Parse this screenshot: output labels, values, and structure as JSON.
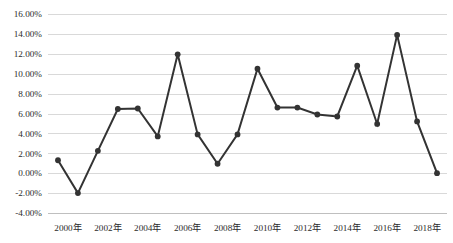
{
  "chart_data": {
    "type": "line",
    "title": "",
    "subtitle": "",
    "xlabel": "",
    "ylabel": "",
    "grid": true,
    "legend": false,
    "legend_position": "none",
    "series_color": "#333333",
    "gridline_color": "#d9d9d9",
    "marker": "circle",
    "x": [
      "2000年",
      "2001年",
      "2002年",
      "2003年",
      "2004年",
      "2005年",
      "2006年",
      "2007年",
      "2008年",
      "2009年",
      "2010年",
      "2011年",
      "2012年",
      "2013年",
      "2014年",
      "2015年",
      "2016年",
      "2017年",
      "2018年",
      "2019年"
    ],
    "values": [
      1.3,
      -2.0,
      2.25,
      6.45,
      6.5,
      3.7,
      11.95,
      3.9,
      0.95,
      3.9,
      10.5,
      6.6,
      6.6,
      5.9,
      5.7,
      10.8,
      4.95,
      13.9,
      5.2,
      0.0
    ],
    "xtick_labels": [
      "2000年",
      "2002年",
      "2004年",
      "2006年",
      "2008年",
      "2010年",
      "2012年",
      "2014年",
      "2016年",
      "2018年"
    ],
    "xtick_indices": [
      0,
      2,
      4,
      6,
      8,
      10,
      12,
      14,
      16,
      18
    ],
    "ytick_labels": [
      "16.00%",
      "14.00%",
      "12.00%",
      "10.00%",
      "8.00%",
      "6.00%",
      "4.00%",
      "2.00%",
      "0.00%",
      "-2.00%",
      "-4.00%"
    ],
    "ytick_values": [
      16,
      14,
      12,
      10,
      8,
      6,
      4,
      2,
      0,
      -2,
      -4
    ],
    "ylim": [
      -4,
      16
    ],
    "ytick_step": 2,
    "xlim_index": [
      -0.5,
      19.5
    ],
    "units": "percent"
  }
}
